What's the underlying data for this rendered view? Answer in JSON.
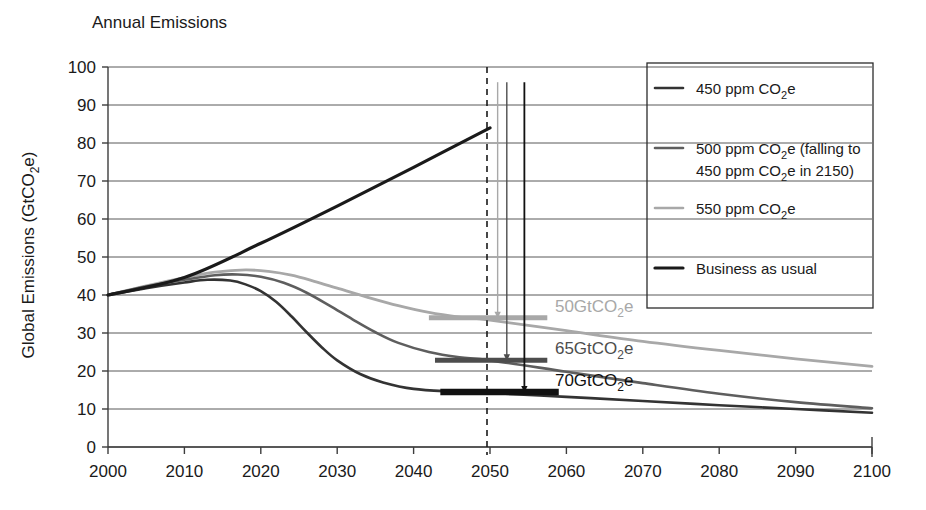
{
  "chart_data": {
    "type": "line",
    "title": "Annual Emissions",
    "xlabel": "",
    "ylabel": "Global Emissions (GtCO2e)",
    "ylabel_parts": {
      "pre": "Global Emissions (GtCO",
      "sub": "2",
      "post": "e)"
    },
    "xlim": [
      2000,
      2100
    ],
    "ylim": [
      0,
      100
    ],
    "grid": true,
    "legend_position": "top-right",
    "xticks": [
      2000,
      2010,
      2020,
      2030,
      2040,
      2050,
      2060,
      2070,
      2080,
      2090,
      2100
    ],
    "yticks": [
      0,
      10,
      20,
      30,
      40,
      50,
      60,
      70,
      80,
      90,
      100
    ],
    "series": [
      {
        "name": "450 ppm CO2e",
        "color": "#333333",
        "width": 2.6,
        "x": [
          2000,
          2005,
          2010,
          2013,
          2016,
          2018,
          2020,
          2022,
          2024,
          2026,
          2028,
          2030,
          2033,
          2036,
          2040,
          2045,
          2050,
          2060,
          2070,
          2080,
          2090,
          2100
        ],
        "y": [
          40.0,
          41.8,
          43.3,
          44.0,
          43.8,
          42.8,
          41.0,
          38.2,
          34.4,
          30.2,
          26.2,
          22.8,
          19.2,
          17.0,
          15.3,
          14.6,
          14.2,
          13.2,
          12.1,
          11.0,
          10.0,
          9.0
        ]
      },
      {
        "name": "500 ppm CO2e (falling to 450 ppm CO2e in 2150)",
        "color": "#5e5e5e",
        "width": 2.6,
        "x": [
          2000,
          2005,
          2010,
          2014,
          2017,
          2020,
          2023,
          2026,
          2029,
          2032,
          2035,
          2038,
          2042,
          2046,
          2050,
          2060,
          2070,
          2080,
          2090,
          2100
        ],
        "y": [
          40.0,
          42.2,
          44.0,
          45.2,
          45.4,
          44.8,
          43.2,
          40.6,
          37.2,
          33.6,
          30.2,
          27.4,
          25.0,
          23.6,
          22.8,
          19.8,
          16.8,
          14.0,
          11.8,
          10.2
        ]
      },
      {
        "name": "550 ppm CO2e",
        "color": "#a8a8a8",
        "width": 2.8,
        "x": [
          2000,
          2005,
          2010,
          2014,
          2018,
          2021,
          2024,
          2027,
          2030,
          2034,
          2038,
          2042,
          2046,
          2050,
          2060,
          2070,
          2080,
          2090,
          2100
        ],
        "y": [
          40.0,
          42.4,
          44.6,
          46.0,
          46.6,
          46.2,
          45.2,
          43.6,
          41.8,
          39.4,
          37.2,
          35.4,
          34.2,
          33.4,
          30.6,
          27.8,
          25.4,
          23.2,
          21.2
        ]
      },
      {
        "name": "Business as usual",
        "color": "#1a1a1a",
        "width": 3.2,
        "x": [
          2000,
          2010,
          2020,
          2030,
          2040,
          2050
        ],
        "y": [
          40.0,
          44.6,
          53.6,
          63.4,
          73.6,
          84.0
        ]
      }
    ],
    "annotations": [
      {
        "label": "50GtCO2e",
        "label_pre": "50GtCO",
        "label_sub": "2",
        "label_post": "e",
        "value": 50,
        "color": "#a8a8a8",
        "bar_y": 34.0,
        "bar_x0": 2042.0,
        "bar_x1": 2057.5,
        "text_x": 2058.5,
        "arrow_x": 2051.0
      },
      {
        "label": "65GtCO2e",
        "label_pre": "65GtCO",
        "label_sub": "2",
        "label_post": "e",
        "value": 65,
        "color": "#4d4d4d",
        "bar_y": 22.8,
        "bar_x0": 2042.8,
        "bar_x1": 2057.5,
        "text_x": 2058.5,
        "arrow_x": 2052.2
      },
      {
        "label": "70GtCO2e",
        "label_pre": "70GtCO",
        "label_sub": "2",
        "label_post": "e",
        "value": 70,
        "color": "#111111",
        "bar_y": 14.5,
        "bar_x0": 2043.5,
        "bar_x1": 2059.0,
        "text_x": 2058.5,
        "arrow_x": 2054.5
      }
    ],
    "marker_line_year": 2050
  },
  "legend": {
    "entries": [
      {
        "label": "450 ppm CO2e",
        "label_pre": "450 ppm CO",
        "label_sub": "2",
        "label_post": "e",
        "color": "#333333",
        "width": 2.6
      },
      {
        "label": "500 ppm CO2e (falling to 450 ppm CO2e in 2150)",
        "line1_pre": "500 ppm CO",
        "line1_sub": "2",
        "line1_post": "e (falling to",
        "line2_pre": "450 ppm CO",
        "line2_sub": "2",
        "line2_post": "e in 2150)",
        "color": "#5e5e5e",
        "width": 2.6
      },
      {
        "label": "550 ppm CO2e",
        "label_pre": "550 ppm CO",
        "label_sub": "2",
        "label_post": "e",
        "color": "#a8a8a8",
        "width": 2.6
      },
      {
        "label": "Business as usual",
        "label_pre": "Business as usual",
        "label_sub": "",
        "label_post": "",
        "color": "#1a1a1a",
        "width": 3.2
      }
    ]
  }
}
